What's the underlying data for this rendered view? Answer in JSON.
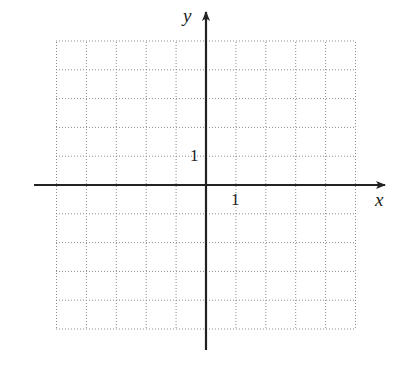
{
  "diagram": {
    "type": "coordinate-grid",
    "axis_labels": {
      "x": "x",
      "y": "y"
    },
    "tick_labels": {
      "x_unit": "1",
      "y_unit": "1"
    },
    "grid": {
      "x_min": -5,
      "x_max": 5,
      "y_min": -5,
      "y_max": 5,
      "step": 1,
      "style": "dotted"
    },
    "colors": {
      "axis": "#222222",
      "grid": "#8a8a8a",
      "background": "#ffffff"
    }
  }
}
